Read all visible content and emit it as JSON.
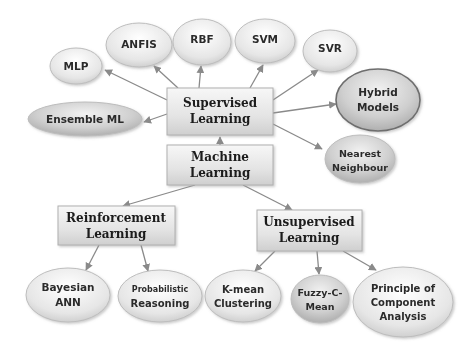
{
  "diagram": {
    "colors": {
      "arrow": "#8a8a8a",
      "ellipse_fill_light": "#f4f4f4",
      "ellipse_fill_dark": "#c8c8c8",
      "box_fill": "#e4e4e4",
      "border": "#9a9a9a"
    },
    "root": {
      "line1": "Machine",
      "line2": "Learning"
    },
    "categories": {
      "supervised": {
        "line1": "Supervised",
        "line2": "Learning"
      },
      "reinforcement": {
        "line1": "Reinforcement",
        "line2": "Learning"
      },
      "unsupervised": {
        "line1": "Unsupervised",
        "line2": "Learning"
      }
    },
    "supervised_methods": [
      {
        "line1": "MLP"
      },
      {
        "line1": "ANFIS"
      },
      {
        "line1": "RBF"
      },
      {
        "line1": "SVM"
      },
      {
        "line1": "SVR"
      },
      {
        "line1": "Hybrid",
        "line2": "Models"
      },
      {
        "line1": "Nearest",
        "line2": "Neighbour"
      },
      {
        "line1": "Ensemble ML"
      }
    ],
    "reinforcement_methods": [
      {
        "line1": "Bayesian",
        "line2": "ANN"
      },
      {
        "line1": "Probabilistic",
        "line2": "Reasoning"
      }
    ],
    "unsupervised_methods": [
      {
        "line1": "K-mean",
        "line2": "Clustering"
      },
      {
        "line1": "Fuzzy-C-",
        "line2": "Mean"
      },
      {
        "line1": "Principle of",
        "line2": "Component",
        "line3": "Analysis"
      }
    ]
  }
}
